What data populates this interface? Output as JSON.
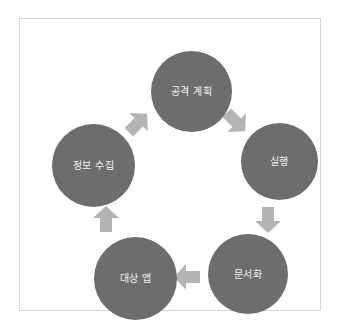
{
  "diagram": {
    "type": "cycle",
    "shape": "pentagon-ring",
    "direction": "clockwise",
    "background_color": "#ffffff",
    "frame_border_color": "#d6d6d6",
    "node_fill_color": "#6d6d6d",
    "node_text_color": "#f2f2f2",
    "arrow_color": "#b4b4b4",
    "nodes": [
      {
        "id": "plan",
        "label": "공격 계획",
        "position": "top"
      },
      {
        "id": "exec",
        "label": "실행",
        "position": "right"
      },
      {
        "id": "doc",
        "label": "문서화",
        "position": "bottom-right"
      },
      {
        "id": "target",
        "label": "대상 앱",
        "position": "bottom-left"
      },
      {
        "id": "recon",
        "label": "정보 수집",
        "position": "left"
      }
    ],
    "arrows": [
      {
        "id": "plan-exec",
        "from": "공격 계획",
        "to": "실행",
        "icon": "arrow-down-right-icon"
      },
      {
        "id": "exec-doc",
        "from": "실행",
        "to": "문서화",
        "icon": "arrow-down-icon"
      },
      {
        "id": "doc-target",
        "from": "문서화",
        "to": "대상 앱",
        "icon": "arrow-left-icon"
      },
      {
        "id": "target-recon",
        "from": "대상 앱",
        "to": "정보 수집",
        "icon": "arrow-up-icon"
      },
      {
        "id": "recon-plan",
        "from": "정보 수집",
        "to": "공격 계획",
        "icon": "arrow-up-right-icon"
      }
    ]
  }
}
